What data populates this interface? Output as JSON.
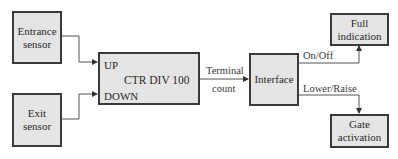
{
  "diagram": {
    "blocks": {
      "entrance_sensor": {
        "line1": "Entrance",
        "line2": "sensor"
      },
      "exit_sensor": {
        "line1": "Exit",
        "line2": "sensor"
      },
      "counter": {
        "title": "CTR DIV 100",
        "port_up": "UP",
        "port_down": "DOWN"
      },
      "interface": {
        "label": "Interface"
      },
      "full_indication": {
        "line1": "Full",
        "line2": "indication"
      },
      "gate_activation": {
        "line1": "Gate",
        "line2": "activation"
      }
    },
    "signals": {
      "terminal_count_line1": "Terminal",
      "terminal_count_line2": "count",
      "on_off": "On/Off",
      "lower_raise": "Lower/Raise"
    },
    "colors": {
      "box_fill": "#e4e4e4",
      "box_border": "#3a3a3a",
      "wire": "#555555"
    }
  }
}
